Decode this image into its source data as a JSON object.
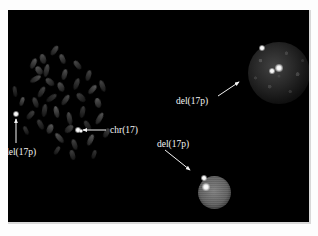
{
  "figure": {
    "type": "fluorescence-in-situ-hybridization-micrograph",
    "background_color": "#000000",
    "page_background": "#fdfdfd",
    "label_color": "#f4f4f4",
    "canvas": {
      "left": 8,
      "top": 10,
      "width": 301,
      "height": 212
    }
  },
  "annotations": [
    {
      "id": "label-del17p-left",
      "text": "del(17p)",
      "x": 4,
      "y": 148,
      "arrow": {
        "x1": 16,
        "y1": 143,
        "x2": 16,
        "y2": 119,
        "direction": "up"
      }
    },
    {
      "id": "label-chr17",
      "text": "chr(17)",
      "x": 110,
      "y": 126,
      "arrow": {
        "x1": 106,
        "y1": 130,
        "x2": 83,
        "y2": 130,
        "direction": "left"
      }
    },
    {
      "id": "label-del17p-upper-right",
      "text": "del(17p)",
      "x": 176,
      "y": 97,
      "arrow": {
        "x1": 218,
        "y1": 96,
        "x2": 239,
        "y2": 82,
        "direction": "up-right"
      }
    },
    {
      "id": "label-del17p-lower-right",
      "text": "del(17p)",
      "x": 157,
      "y": 140,
      "arrow": {
        "x1": 165,
        "y1": 150,
        "x2": 190,
        "y2": 170,
        "direction": "down-right"
      }
    }
  ],
  "nuclei": [
    {
      "id": "nucleus-large",
      "cx": 271,
      "cy": 63,
      "r": 31,
      "signal_count": 3
    },
    {
      "id": "nucleus-small",
      "cx": 206,
      "cy": 182,
      "r": 16,
      "signal_count": 2
    }
  ],
  "signals": [
    {
      "id": "signal-del17p-metaphase",
      "x": 16,
      "y": 114,
      "r": 1.6,
      "region": "metaphase-spread"
    },
    {
      "id": "signal-chr17-metaphase",
      "x": 78,
      "y": 130,
      "r": 1.4,
      "region": "metaphase-spread"
    },
    {
      "id": "signal-chr17-metaphase-b",
      "x": 81,
      "y": 131,
      "r": 1.2,
      "region": "metaphase-spread"
    },
    {
      "id": "signal-nucleus-large-1",
      "x": 262,
      "y": 48,
      "r": 1.8,
      "region": "nucleus-large"
    },
    {
      "id": "signal-nucleus-large-2",
      "x": 279,
      "y": 68,
      "r": 2.0,
      "region": "nucleus-large"
    },
    {
      "id": "signal-nucleus-large-3",
      "x": 272,
      "y": 71,
      "r": 1.5,
      "region": "nucleus-large"
    },
    {
      "id": "signal-nucleus-small-1",
      "x": 204,
      "y": 178,
      "r": 1.4,
      "region": "nucleus-small"
    },
    {
      "id": "signal-nucleus-small-2",
      "x": 206,
      "y": 187,
      "r": 2.0,
      "region": "nucleus-small"
    }
  ],
  "metaphase_spread": {
    "id": "metaphase-spread",
    "center": {
      "x": 75,
      "y": 105
    },
    "chromosomes": [
      {
        "x": 13,
        "y": 86,
        "w": 4,
        "h": 11,
        "rot": -8
      },
      {
        "x": 20,
        "y": 97,
        "w": 4,
        "h": 9,
        "rot": 18
      },
      {
        "x": 31,
        "y": 58,
        "w": 5,
        "h": 11,
        "rot": 25
      },
      {
        "x": 36,
        "y": 66,
        "w": 6,
        "h": 9,
        "rot": -35
      },
      {
        "x": 33,
        "y": 73,
        "w": 5,
        "h": 12,
        "rot": 60
      },
      {
        "x": 40,
        "y": 54,
        "w": 6,
        "h": 10,
        "rot": -15
      },
      {
        "x": 44,
        "y": 64,
        "w": 5,
        "h": 13,
        "rot": 12
      },
      {
        "x": 47,
        "y": 77,
        "w": 6,
        "h": 10,
        "rot": -50
      },
      {
        "x": 39,
        "y": 86,
        "w": 5,
        "h": 12,
        "rot": 30
      },
      {
        "x": 33,
        "y": 97,
        "w": 5,
        "h": 11,
        "rot": -20
      },
      {
        "x": 28,
        "y": 110,
        "w": 5,
        "h": 10,
        "rot": 40
      },
      {
        "x": 42,
        "y": 104,
        "w": 5,
        "h": 13,
        "rot": 8
      },
      {
        "x": 38,
        "y": 119,
        "w": 5,
        "h": 11,
        "rot": -28
      },
      {
        "x": 49,
        "y": 92,
        "w": 5,
        "h": 12,
        "rot": 55
      },
      {
        "x": 54,
        "y": 106,
        "w": 5,
        "h": 12,
        "rot": -12
      },
      {
        "x": 47,
        "y": 124,
        "w": 6,
        "h": 10,
        "rot": 22
      },
      {
        "x": 57,
        "y": 132,
        "w": 5,
        "h": 12,
        "rot": -40
      },
      {
        "x": 62,
        "y": 69,
        "w": 5,
        "h": 11,
        "rot": 15
      },
      {
        "x": 58,
        "y": 82,
        "w": 6,
        "h": 10,
        "rot": -25
      },
      {
        "x": 63,
        "y": 94,
        "w": 5,
        "h": 12,
        "rot": 35
      },
      {
        "x": 67,
        "y": 112,
        "w": 5,
        "h": 13,
        "rot": -10
      },
      {
        "x": 66,
        "y": 124,
        "w": 6,
        "h": 10,
        "rot": 48
      },
      {
        "x": 72,
        "y": 139,
        "w": 5,
        "h": 11,
        "rot": -18
      },
      {
        "x": 74,
        "y": 78,
        "w": 5,
        "h": 12,
        "rot": 20
      },
      {
        "x": 78,
        "y": 92,
        "w": 6,
        "h": 11,
        "rot": -45
      },
      {
        "x": 80,
        "y": 106,
        "w": 5,
        "h": 12,
        "rot": 10
      },
      {
        "x": 85,
        "y": 120,
        "w": 5,
        "h": 11,
        "rot": -30
      },
      {
        "x": 88,
        "y": 134,
        "w": 5,
        "h": 12,
        "rot": 25
      },
      {
        "x": 90,
        "y": 84,
        "w": 5,
        "h": 11,
        "rot": 42
      },
      {
        "x": 95,
        "y": 98,
        "w": 6,
        "h": 10,
        "rot": -14
      },
      {
        "x": 97,
        "y": 112,
        "w": 5,
        "h": 13,
        "rot": 30
      },
      {
        "x": 60,
        "y": 54,
        "w": 5,
        "h": 10,
        "rot": -22
      },
      {
        "x": 52,
        "y": 45,
        "w": 5,
        "h": 11,
        "rot": 35
      },
      {
        "x": 75,
        "y": 60,
        "w": 5,
        "h": 10,
        "rot": -38
      },
      {
        "x": 86,
        "y": 70,
        "w": 5,
        "h": 11,
        "rot": 16
      },
      {
        "x": 100,
        "y": 80,
        "w": 5,
        "h": 12,
        "rot": -20
      },
      {
        "x": 104,
        "y": 128,
        "w": 5,
        "h": 10,
        "rot": 28
      },
      {
        "x": 70,
        "y": 150,
        "w": 5,
        "h": 10,
        "rot": -15
      },
      {
        "x": 55,
        "y": 146,
        "w": 4,
        "h": 9,
        "rot": 32
      },
      {
        "x": 24,
        "y": 126,
        "w": 4,
        "h": 9,
        "rot": -25
      },
      {
        "x": 92,
        "y": 150,
        "w": 4,
        "h": 9,
        "rot": 18
      }
    ]
  }
}
